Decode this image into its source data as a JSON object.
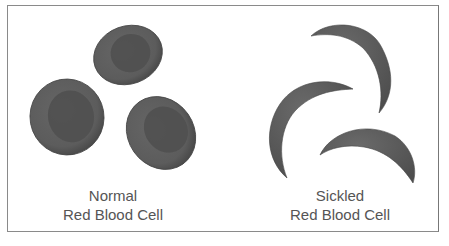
{
  "figure": {
    "panels": [
      {
        "id": "normal",
        "title_line1": "Normal",
        "title_line2": "Red Blood Cell",
        "cell_shape": "biconcave-disc",
        "cell_count": 3
      },
      {
        "id": "sickled",
        "title_line1": "Sickled",
        "title_line2": "Red Blood Cell",
        "cell_shape": "crescent",
        "cell_count": 3
      }
    ],
    "colors": {
      "cell_fill": "#5e5e5e",
      "cell_center": "#4e4e4e",
      "text": "#555555",
      "border": "#8a8a8a"
    }
  }
}
